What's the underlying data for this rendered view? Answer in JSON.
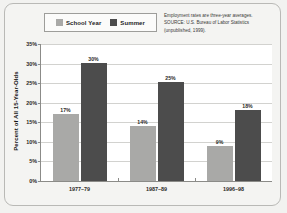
{
  "chart_data": {
    "type": "bar",
    "title": "",
    "xlabel": "",
    "ylabel": "Percent of All 15-Year-Olds",
    "categories": [
      "1977–79",
      "1987–89",
      "1996–98"
    ],
    "series": [
      {
        "name": "School Year",
        "color": "#a9a9a7",
        "values": [
          17,
          14,
          9
        ],
        "labels": [
          "17%",
          "14%",
          "9%"
        ]
      },
      {
        "name": "Summer",
        "color": "#4c4c4c",
        "values": [
          30,
          25,
          18
        ],
        "labels": [
          "30%",
          "25%",
          "18%"
        ]
      }
    ],
    "ylim": [
      0,
      35
    ],
    "yticks": [
      0,
      5,
      10,
      15,
      20,
      25,
      30,
      35
    ],
    "ytick_labels": [
      "0%",
      "5%",
      "10%",
      "15%",
      "20%",
      "25%",
      "30%",
      "35%"
    ],
    "grid": true,
    "legend_position": "top-left"
  },
  "legend": {
    "items": [
      {
        "label": "School Year",
        "color": "#a9a9a7"
      },
      {
        "label": "Summer",
        "color": "#4c4c4c"
      }
    ]
  },
  "note": {
    "lines": [
      "Employment rates are three-year averages.",
      "SOURCE: U.S. Bureau of Labor Statistics",
      "(unpublished, 1999)."
    ]
  }
}
